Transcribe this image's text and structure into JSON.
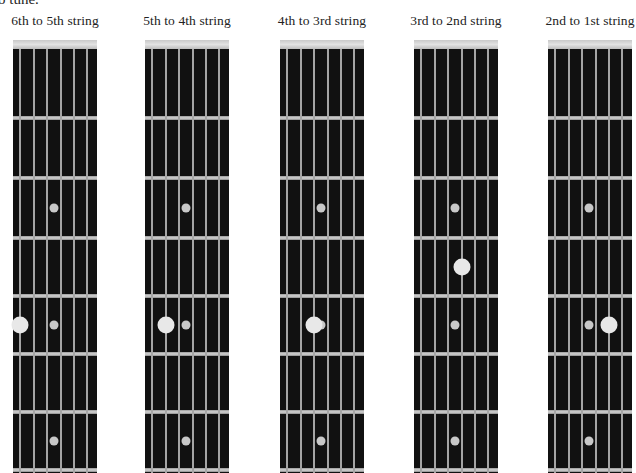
{
  "intro_text": "o tune.",
  "colors": {
    "fretboard": "#111111",
    "string": "#c0c0c0",
    "fret": "#c8c8c8",
    "nut": "#d8d8d8",
    "inlay": "#c8c8c8",
    "finger_dot": "#e8e8e8"
  },
  "fretboard": {
    "strings_left_to_right": [
      "6th",
      "5th",
      "4th",
      "3rd",
      "2nd",
      "1st"
    ],
    "fret_count_visible": 7,
    "inlay_frets": [
      3,
      5,
      7
    ]
  },
  "diagrams": [
    {
      "title": "6th to 5th string",
      "finger": {
        "string": "6th",
        "fret": 5
      }
    },
    {
      "title": "5th to 4th string",
      "finger": {
        "string": "5th",
        "fret": 5
      }
    },
    {
      "title": "4th to 3rd string",
      "finger": {
        "string": "4th",
        "fret": 5
      }
    },
    {
      "title": "3rd to 2nd string",
      "finger": {
        "string": "3rd",
        "fret": 4
      }
    },
    {
      "title": "2nd to 1st string",
      "finger": {
        "string": "2nd",
        "fret": 5
      }
    }
  ]
}
